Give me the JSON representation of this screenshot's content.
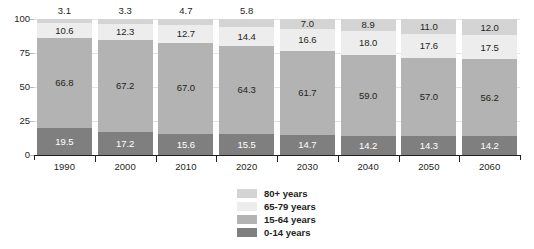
{
  "chart_data": {
    "type": "bar",
    "subtype": "stacked-bar-100",
    "title": "",
    "subtitle": "",
    "xlabel": "",
    "ylabel": "",
    "ylim": [
      0,
      100
    ],
    "yticks": [
      0,
      25,
      50,
      75,
      100
    ],
    "ytick_labels": [
      "0",
      "25",
      "50",
      "75",
      "100"
    ],
    "grid": true,
    "grid_axis": "y",
    "legend_position": "bottom-center",
    "categories": [
      "1990",
      "2000",
      "2010",
      "2020",
      "2030",
      "2040",
      "2050",
      "2060"
    ],
    "series": [
      {
        "name": "0-14 years",
        "color": "#7f7f7f",
        "label_color": "#ffffff",
        "values": [
          19.5,
          17.2,
          15.6,
          15.5,
          14.7,
          14.2,
          14.3,
          14.2
        ],
        "labels": [
          "19.5",
          "17.2",
          "15.6",
          "15.5",
          "14.7",
          "14.2",
          "14.3",
          "14.2"
        ]
      },
      {
        "name": "15-64 years",
        "color": "#b3b3b3",
        "label_color": "#231f20",
        "values": [
          66.8,
          67.2,
          67.0,
          64.3,
          61.7,
          59.0,
          57.0,
          56.2
        ],
        "labels": [
          "66.8",
          "67.2",
          "67.0",
          "64.3",
          "61.7",
          "59.0",
          "57.0",
          "56.2"
        ]
      },
      {
        "name": "65-79 years",
        "color": "#ededed",
        "label_color": "#231f20",
        "values": [
          10.6,
          12.3,
          12.7,
          14.4,
          16.6,
          18.0,
          17.6,
          17.5
        ],
        "labels": [
          "10.6",
          "12.3",
          "12.7",
          "14.4",
          "16.6",
          "18.0",
          "17.6",
          "17.5"
        ]
      },
      {
        "name": "80+ years",
        "color": "#d4d4d4",
        "label_color": "#231f20",
        "values": [
          3.1,
          3.3,
          4.7,
          5.8,
          7.0,
          8.9,
          11.0,
          12.0
        ],
        "labels": [
          "3.1",
          "3.3",
          "4.7",
          "5.8",
          "7.0",
          "8.9",
          "11.0",
          "12.0"
        ],
        "label_placement": [
          "above",
          "above",
          "above",
          "above",
          "inside",
          "inside",
          "inside",
          "inside"
        ]
      }
    ],
    "legend": [
      {
        "label": "80+ years",
        "color": "#d4d4d4"
      },
      {
        "label": "65-79 years",
        "color": "#ededed"
      },
      {
        "label": "15-64 years",
        "color": "#b3b3b3"
      },
      {
        "label": "0-14 years",
        "color": "#7f7f7f"
      }
    ]
  }
}
